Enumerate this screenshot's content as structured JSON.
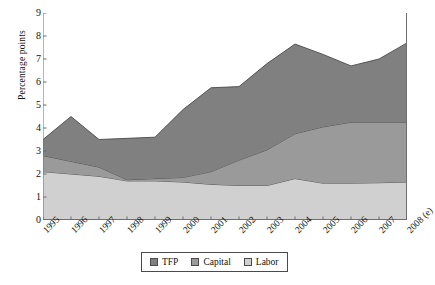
{
  "chart_data": {
    "type": "area",
    "stacked": true,
    "title": "",
    "xlabel": "",
    "ylabel": "Percentage points",
    "ylim": [
      0,
      9
    ],
    "ytick_labels": [
      "0",
      "1",
      "2",
      "3",
      "4",
      "5",
      "6",
      "7",
      "8",
      "9"
    ],
    "grid": false,
    "legend_position": "bottom",
    "categories": [
      "1995",
      "1996",
      "1997",
      "1998",
      "1999",
      "2000",
      "2001",
      "2002",
      "2003",
      "2004",
      "2005",
      "2006",
      "2007",
      "2008 (e)"
    ],
    "series": [
      {
        "name": "Labor",
        "color": "#d0d0d0",
        "values": [
          2.1,
          2.0,
          1.9,
          1.7,
          1.7,
          1.65,
          1.55,
          1.5,
          1.5,
          1.8,
          1.6,
          1.6,
          1.62,
          1.65
        ]
      },
      {
        "name": "Capital",
        "color": "#9a9a9a",
        "values": [
          0.7,
          0.55,
          0.4,
          0.05,
          0.1,
          0.2,
          0.55,
          1.1,
          1.55,
          1.95,
          2.45,
          2.65,
          2.63,
          2.6
        ]
      },
      {
        "name": "TFP",
        "color": "#808080",
        "values": [
          0.7,
          1.95,
          1.2,
          1.8,
          1.8,
          2.95,
          3.65,
          3.2,
          3.75,
          3.9,
          3.15,
          2.45,
          2.75,
          3.45
        ]
      }
    ],
    "stack_order_bottom_to_top": [
      "Labor",
      "Capital",
      "TFP"
    ],
    "totals": [
      3.5,
      4.5,
      3.5,
      3.55,
      3.6,
      4.8,
      5.75,
      5.8,
      6.8,
      7.65,
      7.2,
      6.7,
      7.0,
      7.7
    ],
    "cumulative_labor_top": [
      2.1,
      2.0,
      1.9,
      1.7,
      1.7,
      1.65,
      1.55,
      1.5,
      1.5,
      1.8,
      1.6,
      1.6,
      1.62,
      1.65
    ],
    "cumulative_capital_top": [
      2.8,
      2.55,
      2.3,
      1.75,
      1.8,
      1.85,
      2.1,
      2.6,
      3.05,
      3.75,
      4.05,
      4.25,
      4.25,
      4.25
    ]
  },
  "legend": {
    "items": [
      {
        "label": "TFP",
        "color": "#808080"
      },
      {
        "label": "Capital",
        "color": "#9a9a9a"
      },
      {
        "label": "Labor",
        "color": "#d0d0d0"
      }
    ]
  },
  "axes": {
    "y_title": "Percentage points"
  }
}
